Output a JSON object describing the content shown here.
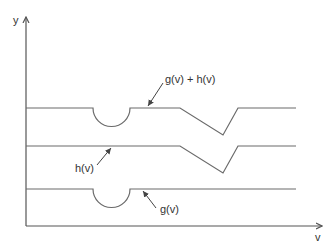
{
  "diagram": {
    "axes": {
      "y_label": "y",
      "x_label": "v"
    },
    "curves": [
      {
        "id": "sum",
        "label": "g(v) + h(v)"
      },
      {
        "id": "h",
        "label": "h(v)"
      },
      {
        "id": "g",
        "label": "g(v)"
      }
    ],
    "colors": {
      "axis": "#555555",
      "curve": "#6a6a6a",
      "text": "#333333",
      "background": "#ffffff"
    }
  }
}
